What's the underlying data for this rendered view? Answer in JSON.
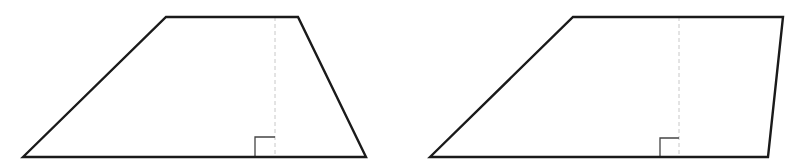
{
  "diagram": {
    "colors": {
      "outline": "#1a1a1a",
      "height_line": "#c8c8c8",
      "right_angle_marker": "#444444",
      "background": "#ffffff"
    },
    "shapes": [
      {
        "id": "trapezoid-left",
        "type": "trapezoid",
        "vertices": [
          [
            23,
            157
          ],
          [
            166,
            17
          ],
          [
            298,
            17
          ],
          [
            366,
            157
          ]
        ],
        "height_line": {
          "x": 275,
          "y_top": 17,
          "y_bottom": 157,
          "style": "dashed"
        },
        "right_angle_marker": {
          "corner": [
            275,
            157
          ],
          "size": 20,
          "side": "left"
        }
      },
      {
        "id": "trapezoid-right",
        "type": "trapezoid",
        "vertices": [
          [
            430,
            157
          ],
          [
            573,
            17
          ],
          [
            783,
            17
          ],
          [
            768,
            157
          ]
        ],
        "height_line": {
          "x": 679,
          "y_top": 17,
          "y_bottom": 157,
          "style": "dashed"
        },
        "right_angle_marker": {
          "corner": [
            679,
            157
          ],
          "size": 19,
          "side": "left"
        }
      }
    ]
  }
}
